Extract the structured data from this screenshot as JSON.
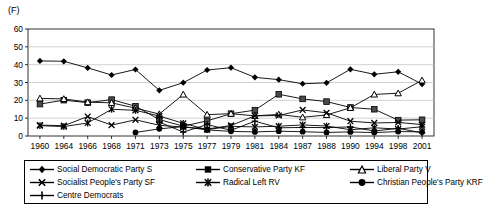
{
  "figure": {
    "label": "(F)"
  },
  "chart_data": {
    "type": "line",
    "title": "(F)",
    "xlabel": "",
    "ylabel": "",
    "ylim": [
      0,
      60
    ],
    "yticks": [
      0,
      10,
      20,
      30,
      40,
      50,
      60
    ],
    "ytick_labels": [
      "0",
      "10",
      "20",
      "30",
      "40",
      "50",
      "60"
    ],
    "grid": "horizontal",
    "legend_position": "bottom",
    "categories": [
      "1960",
      "1964",
      "1966",
      "1968",
      "1971",
      "1973",
      "1975",
      "1977",
      "1979",
      "1981",
      "1984",
      "1987",
      "1988",
      "1990",
      "1994",
      "1998",
      "2001"
    ],
    "series": [
      {
        "name": "Social Democratic Party S",
        "marker": "diamond",
        "color": "#000000",
        "values": [
          42.1,
          41.9,
          38.2,
          34.2,
          37.3,
          25.6,
          29.9,
          37.0,
          38.3,
          32.9,
          31.6,
          29.3,
          29.8,
          37.4,
          34.6,
          36.0,
          29.1
        ]
      },
      {
        "name": "Conservative Party KF",
        "marker": "square",
        "color": "#000000",
        "values": [
          17.9,
          20.1,
          18.7,
          20.4,
          16.7,
          9.2,
          5.5,
          8.5,
          12.5,
          14.5,
          23.4,
          20.8,
          19.3,
          16.0,
          15.0,
          8.9,
          9.1
        ]
      },
      {
        "name": "Liberal Party V",
        "marker": "triangle",
        "color": "#000000",
        "values": [
          21.1,
          20.8,
          19.0,
          18.6,
          15.6,
          12.3,
          23.3,
          12.0,
          12.5,
          11.3,
          12.1,
          10.5,
          11.8,
          15.8,
          23.3,
          24.0,
          31.2
        ]
      },
      {
        "name": "Socialist People's Party SF",
        "marker": "x",
        "color": "#000000",
        "values": [
          6.1,
          5.8,
          10.9,
          6.1,
          9.1,
          6.0,
          5.0,
          3.9,
          5.9,
          11.3,
          11.5,
          14.6,
          13.0,
          8.3,
          7.3,
          7.6,
          6.4
        ]
      },
      {
        "name": "Radical Left RV",
        "marker": "star",
        "color": "#000000",
        "values": [
          5.8,
          5.3,
          7.3,
          15.0,
          14.4,
          11.2,
          7.1,
          3.6,
          5.4,
          5.1,
          5.5,
          6.2,
          5.6,
          3.5,
          4.6,
          3.9,
          5.2
        ]
      },
      {
        "name": "Christian People's Party KRF",
        "marker": "circle",
        "color": "#000000",
        "values": [
          null,
          null,
          null,
          null,
          2.0,
          4.0,
          5.3,
          3.4,
          2.6,
          2.3,
          2.7,
          2.4,
          2.0,
          2.3,
          1.9,
          2.5,
          2.3
        ]
      },
      {
        "name": "Centre Democrats",
        "marker": "plus",
        "color": "#000000",
        "values": [
          null,
          null,
          null,
          null,
          null,
          7.8,
          2.2,
          6.4,
          3.2,
          8.3,
          4.6,
          4.8,
          4.7,
          5.1,
          2.8,
          4.3,
          1.8
        ]
      }
    ]
  },
  "legend": {
    "items": [
      {
        "label": "Social Democratic Party S",
        "marker": "diamond"
      },
      {
        "label": "Conservative Party KF",
        "marker": "square"
      },
      {
        "label": "Liberal Party V",
        "marker": "triangle"
      },
      {
        "label": "Socialist People's Party SF",
        "marker": "x"
      },
      {
        "label": "Radical Left RV",
        "marker": "star"
      },
      {
        "label": "Christian People's Party KRF",
        "marker": "circle"
      },
      {
        "label": "Centre Democrats",
        "marker": "plus"
      }
    ]
  }
}
